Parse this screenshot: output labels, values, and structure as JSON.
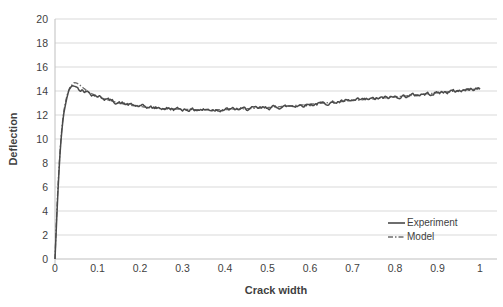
{
  "chart": {
    "y_axis": {
      "title": "Deflection",
      "tick_values": [
        0,
        2,
        4,
        6,
        8,
        10,
        12,
        14,
        16,
        18,
        20
      ],
      "tick_labels": [
        "0",
        "2",
        "4",
        "6",
        "8",
        "10",
        "12",
        "14",
        "16",
        "18",
        "20"
      ]
    },
    "x_axis": {
      "title": "Crack width",
      "tick_values": [
        0,
        0.1,
        0.2,
        0.3,
        0.4,
        0.5,
        0.6,
        0.7,
        0.8,
        0.9,
        1
      ],
      "tick_labels": [
        "0",
        "0.1",
        "0.2",
        "0.3",
        "0.4",
        "0.5",
        "0.6",
        "0.7",
        "0.8",
        "0.9",
        "1"
      ]
    },
    "legend": {
      "items": [
        {
          "label": "Experiment",
          "color": "#4a4a4a",
          "dash": ""
        },
        {
          "label": "Model",
          "color": "#6e6e6e",
          "dash": "5 2 1.5 2"
        }
      ]
    },
    "colors": {
      "grid": "#d9d9d9",
      "axis": "#bfbfbf",
      "text": "#3f3f3f",
      "background": "#ffffff"
    }
  },
  "chart_data": {
    "type": "line",
    "title": "",
    "xlabel": "Crack width",
    "ylabel": "Deflection",
    "xlim": [
      0,
      1
    ],
    "ylim": [
      0,
      20
    ],
    "grid": "horizontal",
    "legend_position": "inside-bottom-right",
    "series": [
      {
        "name": "Model",
        "style": "dash-dot",
        "color": "#6e6e6e",
        "points": [
          [
            0,
            0
          ],
          [
            0.003,
            3
          ],
          [
            0.006,
            5.5
          ],
          [
            0.01,
            8
          ],
          [
            0.015,
            10.5
          ],
          [
            0.02,
            12.2
          ],
          [
            0.027,
            13.5
          ],
          [
            0.035,
            14.3
          ],
          [
            0.045,
            14.72
          ],
          [
            0.055,
            14.6
          ],
          [
            0.065,
            14.3
          ],
          [
            0.08,
            13.9
          ],
          [
            0.1,
            13.55
          ],
          [
            0.12,
            13.3
          ],
          [
            0.15,
            13.0
          ],
          [
            0.18,
            12.8
          ],
          [
            0.22,
            12.62
          ],
          [
            0.26,
            12.52
          ],
          [
            0.3,
            12.47
          ],
          [
            0.35,
            12.43
          ],
          [
            0.4,
            12.45
          ],
          [
            0.45,
            12.52
          ],
          [
            0.5,
            12.62
          ],
          [
            0.55,
            12.75
          ],
          [
            0.6,
            12.9
          ],
          [
            0.65,
            13.05
          ],
          [
            0.7,
            13.2
          ],
          [
            0.75,
            13.35
          ],
          [
            0.8,
            13.5
          ],
          [
            0.85,
            13.67
          ],
          [
            0.9,
            13.85
          ],
          [
            0.95,
            14.02
          ],
          [
            1,
            14.2
          ]
        ]
      },
      {
        "name": "Experiment",
        "style": "solid-noisy",
        "color": "#4a4a4a",
        "points": [
          [
            0,
            0
          ],
          [
            0.003,
            2.5
          ],
          [
            0.006,
            5
          ],
          [
            0.01,
            7.8
          ],
          [
            0.015,
            10.3
          ],
          [
            0.02,
            12.0
          ],
          [
            0.027,
            13.3
          ],
          [
            0.033,
            14.1
          ],
          [
            0.04,
            14.45
          ],
          [
            0.05,
            14.35
          ],
          [
            0.06,
            14.15
          ],
          [
            0.075,
            13.95
          ],
          [
            0.09,
            13.7
          ],
          [
            0.11,
            13.45
          ],
          [
            0.14,
            13.1
          ],
          [
            0.17,
            12.88
          ],
          [
            0.2,
            12.72
          ],
          [
            0.24,
            12.58
          ],
          [
            0.28,
            12.5
          ],
          [
            0.33,
            12.44
          ],
          [
            0.38,
            12.44
          ],
          [
            0.43,
            12.48
          ],
          [
            0.48,
            12.56
          ],
          [
            0.53,
            12.68
          ],
          [
            0.58,
            12.82
          ],
          [
            0.63,
            12.97
          ],
          [
            0.68,
            13.12
          ],
          [
            0.73,
            13.28
          ],
          [
            0.78,
            13.44
          ],
          [
            0.83,
            13.6
          ],
          [
            0.88,
            13.78
          ],
          [
            0.93,
            13.95
          ],
          [
            1,
            14.22
          ]
        ]
      }
    ]
  }
}
